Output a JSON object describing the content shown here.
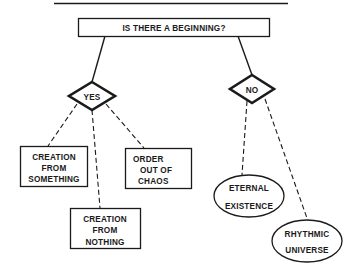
{
  "diagram": {
    "root": {
      "label": "IS THERE A BEGINNING?"
    },
    "branches": [
      {
        "label": "YES",
        "children": [
          {
            "lines": [
              "CREATION",
              "FROM",
              "SOMETHING"
            ],
            "shape": "rectangle"
          },
          {
            "lines": [
              "CREATION",
              "FROM",
              "NOTHING"
            ],
            "shape": "rectangle"
          },
          {
            "lines": [
              "ORDER",
              "OUT OF",
              "CHAOS"
            ],
            "shape": "rectangle"
          }
        ]
      },
      {
        "label": "NO",
        "children": [
          {
            "lines": [
              "ETERNAL",
              "EXISTENCE"
            ],
            "shape": "ellipse"
          },
          {
            "lines": [
              "RHYTHMIC",
              "UNIVERSE"
            ],
            "shape": "ellipse"
          }
        ]
      }
    ]
  },
  "colors": {
    "ink": "#1a1a1a",
    "background": "#ffffff"
  }
}
